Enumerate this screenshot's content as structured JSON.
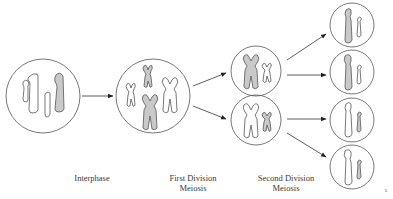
{
  "diagram": {
    "stages": [
      {
        "id": "interphase",
        "label_line1": "Interphase",
        "label_line2": ""
      },
      {
        "id": "first-division",
        "label_line1": "First Division",
        "label_line2": "Meiosis"
      },
      {
        "id": "second-division",
        "label_line1": "Second Division",
        "label_line2": "Meiosis"
      }
    ],
    "page_mark": "5",
    "colors": {
      "outline": "#555555",
      "shaded_chromosome": "#c9c9c9",
      "background": "#ffffff",
      "label_text": "#3a3a3a"
    },
    "cells": {
      "interphase_count": 1,
      "first_division_count": 1,
      "second_division_count": 2,
      "gamete_count": 4
    }
  }
}
